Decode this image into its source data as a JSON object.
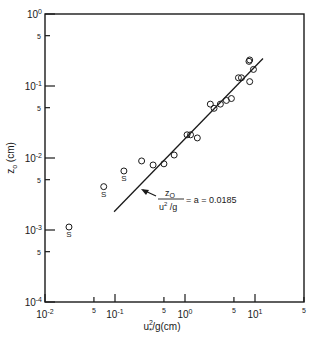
{
  "chart_data": {
    "type": "scatter",
    "title": "",
    "xlabel": "u*²/g (cm)",
    "ylabel": "z₀ (cm)",
    "xscale": "log",
    "yscale": "log",
    "xlim": [
      0.01,
      50
    ],
    "ylim": [
      0.0001,
      1
    ],
    "grid": false,
    "x_ticks": [
      {
        "value": 0.01,
        "label": "10",
        "exp": "-2"
      },
      {
        "value": 0.05,
        "label": "5",
        "exp": ""
      },
      {
        "value": 0.1,
        "label": "10",
        "exp": "-1"
      },
      {
        "value": 0.5,
        "label": "5",
        "exp": ""
      },
      {
        "value": 1,
        "label": "10",
        "exp": "0"
      },
      {
        "value": 5,
        "label": "5",
        "exp": ""
      },
      {
        "value": 10,
        "label": "10",
        "exp": "1"
      },
      {
        "value": 50,
        "label": "5",
        "exp": ""
      }
    ],
    "y_ticks": [
      {
        "value": 1,
        "label": "10",
        "exp": "0"
      },
      {
        "value": 0.5,
        "label": "5",
        "exp": ""
      },
      {
        "value": 0.1,
        "label": "10",
        "exp": "-1"
      },
      {
        "value": 0.05,
        "label": "5",
        "exp": ""
      },
      {
        "value": 0.01,
        "label": "10",
        "exp": "-2"
      },
      {
        "value": 0.005,
        "label": "5",
        "exp": ""
      },
      {
        "value": 0.001,
        "label": "10",
        "exp": "-3"
      },
      {
        "value": 0.0005,
        "label": "5",
        "exp": ""
      },
      {
        "value": 0.0001,
        "label": "10",
        "exp": "-4"
      }
    ],
    "series": [
      {
        "name": "measurements",
        "marker": "open-circle",
        "points": [
          {
            "x": 0.24,
            "y": 0.0091
          },
          {
            "x": 0.35,
            "y": 0.008
          },
          {
            "x": 0.5,
            "y": 0.0083
          },
          {
            "x": 0.7,
            "y": 0.011
          },
          {
            "x": 1.07,
            "y": 0.021
          },
          {
            "x": 1.2,
            "y": 0.021
          },
          {
            "x": 1.5,
            "y": 0.019
          },
          {
            "x": 2.3,
            "y": 0.056
          },
          {
            "x": 2.6,
            "y": 0.049
          },
          {
            "x": 3.2,
            "y": 0.056
          },
          {
            "x": 3.9,
            "y": 0.063
          },
          {
            "x": 4.6,
            "y": 0.067
          },
          {
            "x": 5.8,
            "y": 0.13
          },
          {
            "x": 6.4,
            "y": 0.13
          },
          {
            "x": 8.2,
            "y": 0.22
          },
          {
            "x": 8.4,
            "y": 0.23
          },
          {
            "x": 8.4,
            "y": 0.115
          },
          {
            "x": 9.5,
            "y": 0.17
          }
        ]
      },
      {
        "name": "S-labelled measurements",
        "marker": "open-circle-with-S",
        "point_label": "S",
        "points": [
          {
            "x": 0.022,
            "y": 0.0011
          },
          {
            "x": 0.069,
            "y": 0.004
          },
          {
            "x": 0.134,
            "y": 0.0066
          }
        ]
      }
    ],
    "fit_line": {
      "name": "Charnock relation",
      "coefficient": 0.0185,
      "x_range": [
        0.097,
        13
      ],
      "annotation": {
        "numerator": "z",
        "numerator_sub": "O",
        "denominator": "u",
        "denominator_sup": "2",
        "denominator_sub": "*",
        "denominator_rest": "/g",
        "rhs": "= a = 0.0185"
      }
    }
  }
}
